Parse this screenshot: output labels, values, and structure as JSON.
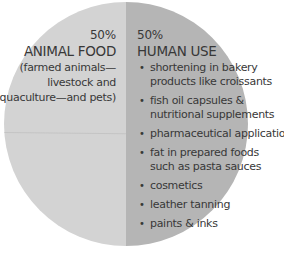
{
  "chart_data": {
    "type": "pie",
    "title": "",
    "categories": [
      "ANIMAL FOOD",
      "HUMAN USE"
    ],
    "values": [
      50,
      50
    ],
    "labels": [
      "50%",
      "50%"
    ],
    "colors": [
      "#d3d3d3",
      "#b5b5b5"
    ],
    "slices": [
      {
        "name": "ANIMAL FOOD",
        "percent": 50,
        "description": "(farmed animals—livestock and aquaculture—and pets)"
      },
      {
        "name": "HUMAN USE",
        "percent": 50,
        "items": [
          "shortening in bakery products like croissants",
          "fish oil capsules & nutritional supplements",
          "pharmaceutical applications",
          "fat in prepared foods such as pasta sauces",
          "cosmetics",
          "leather tanning",
          "paints & inks"
        ]
      }
    ],
    "legend": "none (inline labels)"
  },
  "animal": {
    "pct": "50%",
    "title": "ANIMAL FOOD",
    "desc_lines": [
      "(farmed animals—",
      "livestock and",
      "aquaculture—and pets)"
    ]
  },
  "human": {
    "pct": "50%",
    "title": "HUMAN USE",
    "bullet": "•",
    "items": [
      {
        "l1": "shortening in bakery",
        "l2": "products like croissants"
      },
      {
        "l1": "fish oil capsules &",
        "l2": "nutritional supplements"
      },
      {
        "l1": "pharmaceutical applications",
        "l2": ""
      },
      {
        "l1": "fat in prepared foods",
        "l2": "such as pasta sauces"
      },
      {
        "l1": "cosmetics",
        "l2": ""
      },
      {
        "l1": "leather tanning",
        "l2": ""
      },
      {
        "l1": "paints & inks",
        "l2": ""
      }
    ]
  }
}
